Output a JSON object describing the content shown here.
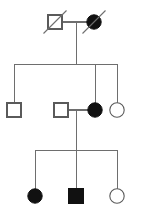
{
  "diagram": {
    "type": "pedigree",
    "background_color": "#ffffff",
    "line_color": "#6e6e6e",
    "symbol_stroke_color": "#5a5a5a",
    "affected_fill_color": "#111111",
    "unaffected_fill_color": "#ffffff",
    "deceased_slash_color": "#6e6e6e",
    "legend": {
      "square_meaning": "male",
      "circle_meaning": "female",
      "filled_meaning": "affected",
      "open_meaning": "unaffected",
      "slash_meaning": "deceased"
    },
    "generations": [
      {
        "id": "I",
        "label": "I",
        "members": [
          {
            "id": "I-1",
            "shape": "square",
            "sex": "male",
            "affected": false,
            "deceased": true,
            "cx": 55,
            "cy": 22,
            "size": 14
          },
          {
            "id": "I-2",
            "shape": "circle",
            "sex": "female",
            "affected": true,
            "deceased": true,
            "cx": 94,
            "cy": 22,
            "size": 14
          }
        ],
        "mating_line": {
          "x1": 62,
          "x2": 87,
          "y": 22
        },
        "descent_line": {
          "x": 76,
          "y1": 22,
          "y2": 64
        }
      },
      {
        "id": "II",
        "label": "II",
        "sibship_line": {
          "x1": 14,
          "x2": 117,
          "y": 64
        },
        "members": [
          {
            "id": "II-1",
            "shape": "square",
            "sex": "male",
            "affected": false,
            "deceased": false,
            "cx": 14,
            "cy": 110,
            "size": 14,
            "drop_line": {
              "x": 14,
              "y1": 64,
              "y2": 103
            }
          },
          {
            "id": "II-2",
            "shape": "square",
            "sex": "male",
            "affected": false,
            "deceased": false,
            "cx": 61,
            "cy": 110,
            "size": 14,
            "spouse": true
          },
          {
            "id": "II-3",
            "shape": "circle",
            "sex": "female",
            "affected": true,
            "deceased": false,
            "cx": 95,
            "cy": 110,
            "size": 14,
            "drop_line": {
              "x": 95,
              "y1": 64,
              "y2": 103
            }
          },
          {
            "id": "II-4",
            "shape": "circle",
            "sex": "female",
            "affected": false,
            "deceased": false,
            "cx": 117,
            "cy": 110,
            "size": 14,
            "drop_line": {
              "x": 117,
              "y1": 64,
              "y2": 103
            }
          }
        ],
        "mating_line": {
          "x1": 68,
          "x2": 88,
          "y": 110
        },
        "descent_line": {
          "x": 76,
          "y1": 110,
          "y2": 150
        }
      },
      {
        "id": "III",
        "label": "III",
        "sibship_line": {
          "x1": 35,
          "x2": 117,
          "y": 150
        },
        "members": [
          {
            "id": "III-1",
            "shape": "circle",
            "sex": "female",
            "affected": true,
            "deceased": false,
            "cx": 35,
            "cy": 196,
            "size": 14,
            "drop_line": {
              "x": 35,
              "y1": 150,
              "y2": 189
            }
          },
          {
            "id": "III-2",
            "shape": "square",
            "sex": "male",
            "affected": true,
            "deceased": false,
            "cx": 76,
            "cy": 196,
            "size": 15,
            "drop_line": {
              "x": 76,
              "y1": 150,
              "y2": 189
            }
          },
          {
            "id": "III-3",
            "shape": "circle",
            "sex": "female",
            "affected": false,
            "deceased": false,
            "cx": 117,
            "cy": 196,
            "size": 14,
            "drop_line": {
              "x": 117,
              "y1": 150,
              "y2": 189
            }
          }
        ]
      }
    ]
  }
}
